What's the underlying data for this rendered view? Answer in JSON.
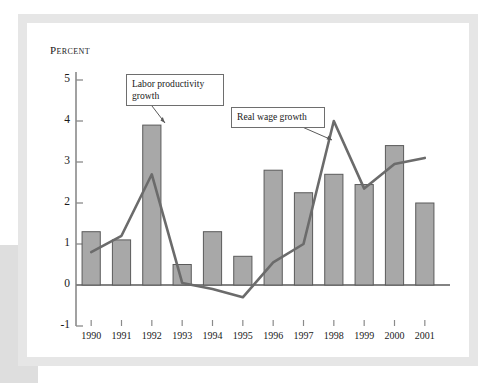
{
  "figure": {
    "axis_title": "Percent",
    "bar_color": "#a8a8a8",
    "bar_edge_color": "#5a5a5a",
    "line_color": "#6b6b6b",
    "frame_color": "#e6e6e6",
    "background": "#ffffff"
  },
  "callouts": {
    "labor": "Labor productivity growth",
    "wage": "Real wage growth"
  },
  "chart_data": {
    "type": "bar",
    "title": "",
    "xlabel": "",
    "ylabel": "Percent",
    "ylim": [
      -1,
      5
    ],
    "yticks": [
      -1,
      0,
      1,
      2,
      3,
      4,
      5
    ],
    "ytick_labels": [
      "-1",
      "0",
      "1",
      "2",
      "3",
      "4",
      "5"
    ],
    "grid": false,
    "legend": "callout-annotations",
    "categories": [
      "1990",
      "1991",
      "1992",
      "1993",
      "1994",
      "1995",
      "1996",
      "1997",
      "1998",
      "1999",
      "2000",
      "2001"
    ],
    "series": [
      {
        "name": "Labor productivity growth",
        "type": "bar",
        "values": [
          1.3,
          1.1,
          3.9,
          0.5,
          1.3,
          0.7,
          2.8,
          2.25,
          2.7,
          2.45,
          3.4,
          2.0
        ]
      },
      {
        "name": "Real wage growth",
        "type": "line",
        "values": [
          0.8,
          1.2,
          2.7,
          0.05,
          -0.1,
          -0.3,
          0.55,
          1.0,
          4.0,
          2.35,
          2.95,
          3.1
        ]
      }
    ]
  }
}
